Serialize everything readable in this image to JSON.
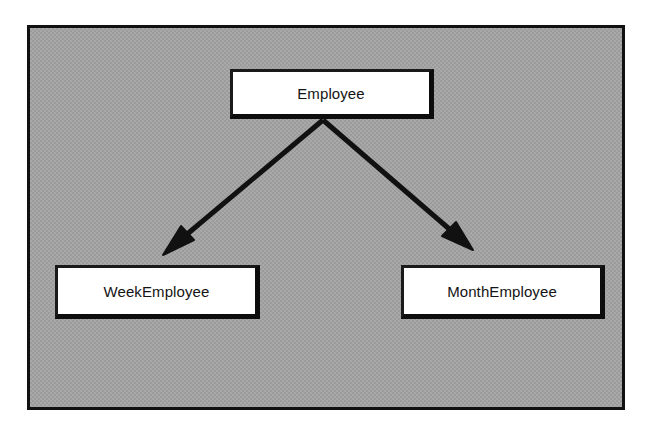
{
  "diagram": {
    "kind": "uml-class-inheritance-diagram",
    "frame": {
      "name": "diagram-frame",
      "background_color": "#a9a9a9",
      "border_color": "#111111"
    },
    "classes": [
      {
        "id": "employee",
        "name": "Employee",
        "role": "superclass",
        "fill_color": "#ffffff",
        "border_color": "#1a1a1a"
      },
      {
        "id": "weekemployee",
        "name": "WeekEmployee",
        "role": "subclass",
        "fill_color": "#ffffff",
        "border_color": "#1a1a1a"
      },
      {
        "id": "monthemployee",
        "name": "MonthEmployee",
        "role": "subclass",
        "fill_color": "#ffffff",
        "border_color": "#1a1a1a"
      }
    ],
    "relationships": [
      {
        "id": "employee-to-weekemployee",
        "type": "generalization",
        "from": "Employee",
        "to": "WeekEmployee",
        "arrow_style": "solid-filled-triangle",
        "line_color": "#111111"
      },
      {
        "id": "employee-to-monthemployee",
        "type": "generalization",
        "from": "Employee",
        "to": "MonthEmployee",
        "arrow_style": "solid-filled-triangle",
        "line_color": "#111111"
      }
    ]
  }
}
